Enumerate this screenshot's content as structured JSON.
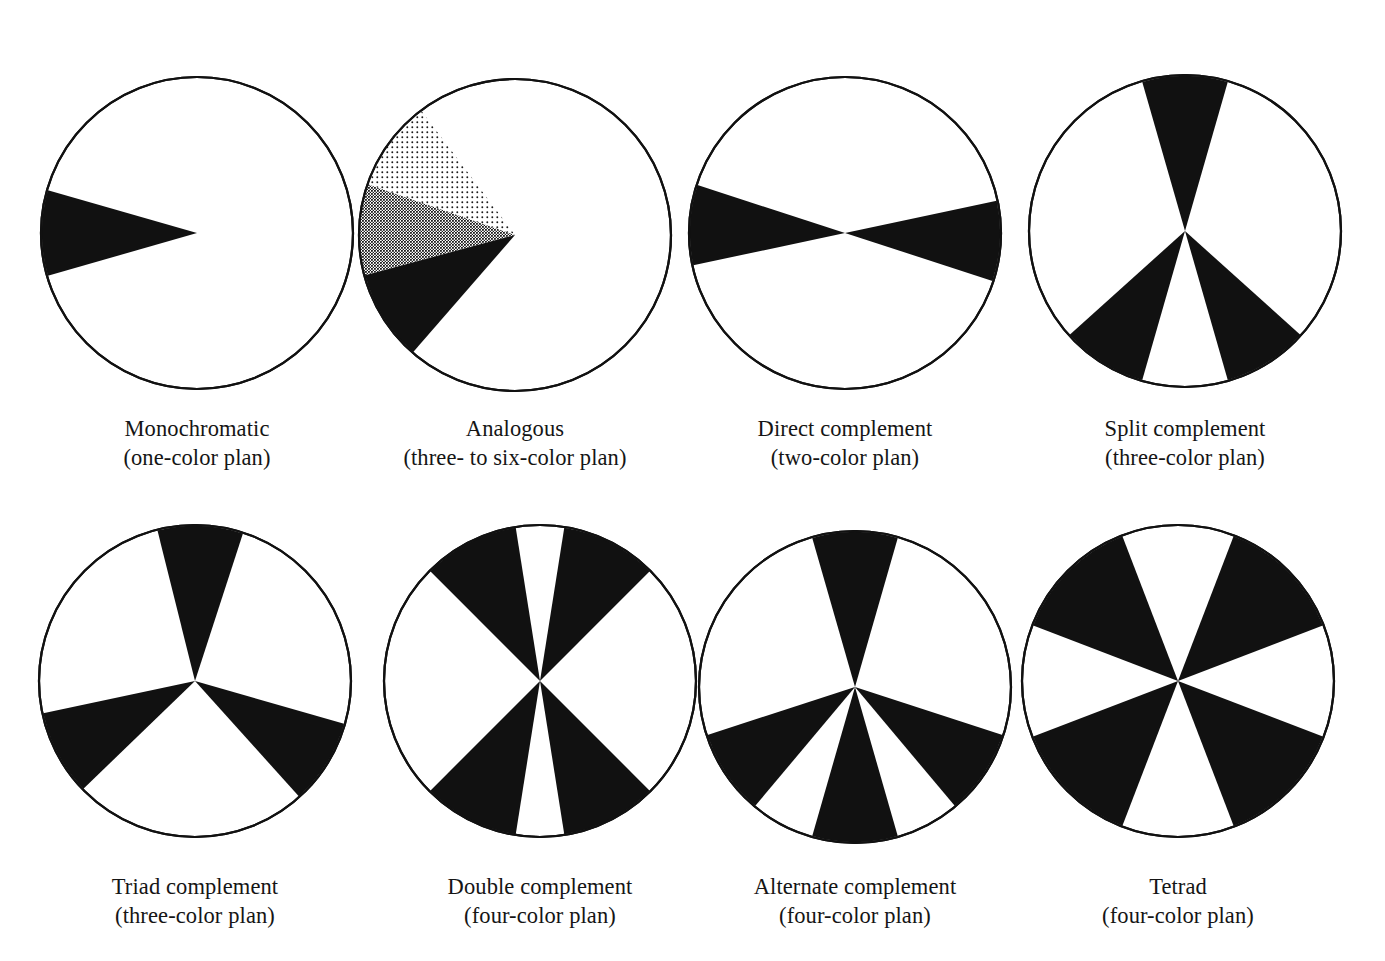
{
  "figure": {
    "background_color": "#ffffff",
    "ink_color": "#111111",
    "outline_color": "#111111",
    "wheel_diameter_px": 312,
    "columns": 4,
    "rows": 2
  },
  "swatch_fills": {
    "solid": "#111111",
    "medium": "#4c4c4c",
    "light": "#d8d8d8",
    "empty": "#ffffff"
  },
  "chart_data": {
    "type": "pie",
    "xlabel": "",
    "ylabel": "",
    "legend": "none",
    "grid": false,
    "note": "Eight color wheels; each filled wedge marks a hue position used by that harmony plan. Angles in degrees measured clockwise from 12 o'clock (top).",
    "wheels": [
      {
        "id": "monochromatic",
        "title": "Monochromatic",
        "subtitle": "(one-color plan)",
        "color_count": 1,
        "wedges": [
          {
            "center_deg": 270,
            "width_deg": 32,
            "fill": "solid"
          }
        ]
      },
      {
        "id": "analogous",
        "title": "Analogous",
        "subtitle": "(three- to six-color plan)",
        "color_count": 3,
        "wedges": [
          {
            "center_deg": 306,
            "width_deg": 34,
            "fill": "light"
          },
          {
            "center_deg": 272,
            "width_deg": 34,
            "fill": "medium"
          },
          {
            "center_deg": 238,
            "width_deg": 34,
            "fill": "solid"
          }
        ]
      },
      {
        "id": "direct-complement",
        "title": "Direct complement",
        "subtitle": "(two-color plan)",
        "color_count": 2,
        "wedges": [
          {
            "center_deg": 273,
            "width_deg": 30,
            "fill": "solid"
          },
          {
            "center_deg": 93,
            "width_deg": 30,
            "fill": "solid"
          }
        ]
      },
      {
        "id": "split-complement",
        "title": "Split complement",
        "subtitle": "(three-color plan)",
        "color_count": 3,
        "wedges": [
          {
            "center_deg": 0,
            "width_deg": 32,
            "fill": "solid"
          },
          {
            "center_deg": 148,
            "width_deg": 32,
            "fill": "solid"
          },
          {
            "center_deg": 212,
            "width_deg": 32,
            "fill": "solid"
          }
        ]
      },
      {
        "id": "triad-complement",
        "title": "Triad complement",
        "subtitle": "(three-color plan)",
        "color_count": 3,
        "wedges": [
          {
            "center_deg": 2,
            "width_deg": 32,
            "fill": "solid"
          },
          {
            "center_deg": 122,
            "width_deg": 32,
            "fill": "solid"
          },
          {
            "center_deg": 242,
            "width_deg": 32,
            "fill": "solid"
          }
        ]
      },
      {
        "id": "double-complement",
        "title": "Double complement",
        "subtitle": "(four-color plan)",
        "color_count": 4,
        "wedges": [
          {
            "center_deg": 27,
            "width_deg": 36,
            "fill": "solid"
          },
          {
            "center_deg": 207,
            "width_deg": 36,
            "fill": "solid"
          },
          {
            "center_deg": 333,
            "width_deg": 36,
            "fill": "solid"
          },
          {
            "center_deg": 153,
            "width_deg": 36,
            "fill": "solid"
          }
        ]
      },
      {
        "id": "alternate-complement",
        "title": "Alternate complement",
        "subtitle": "(four-color plan)",
        "color_count": 4,
        "wedges": [
          {
            "center_deg": 0,
            "width_deg": 32,
            "fill": "solid"
          },
          {
            "center_deg": 124,
            "width_deg": 32,
            "fill": "solid"
          },
          {
            "center_deg": 180,
            "width_deg": 32,
            "fill": "solid"
          },
          {
            "center_deg": 236,
            "width_deg": 32,
            "fill": "solid"
          }
        ]
      },
      {
        "id": "tetrad",
        "title": "Tetrad",
        "subtitle": "(four-color plan)",
        "color_count": 4,
        "wedges": [
          {
            "center_deg": 45,
            "width_deg": 48,
            "fill": "solid"
          },
          {
            "center_deg": 135,
            "width_deg": 48,
            "fill": "solid"
          },
          {
            "center_deg": 225,
            "width_deg": 48,
            "fill": "solid"
          },
          {
            "center_deg": 315,
            "width_deg": 48,
            "fill": "solid"
          }
        ]
      }
    ]
  },
  "layout": {
    "wheel_positions": [
      {
        "cx": 197,
        "cy": 230,
        "caption_y": 408
      },
      {
        "cx": 515,
        "cy": 232,
        "caption_y": 408
      },
      {
        "cx": 845,
        "cy": 230,
        "caption_y": 408
      },
      {
        "cx": 1185,
        "cy": 228,
        "caption_y": 408
      },
      {
        "cx": 195,
        "cy": 678,
        "caption_y": 866
      },
      {
        "cx": 540,
        "cy": 678,
        "caption_y": 866
      },
      {
        "cx": 855,
        "cy": 684,
        "caption_y": 866
      },
      {
        "cx": 1178,
        "cy": 678,
        "caption_y": 866
      }
    ]
  }
}
